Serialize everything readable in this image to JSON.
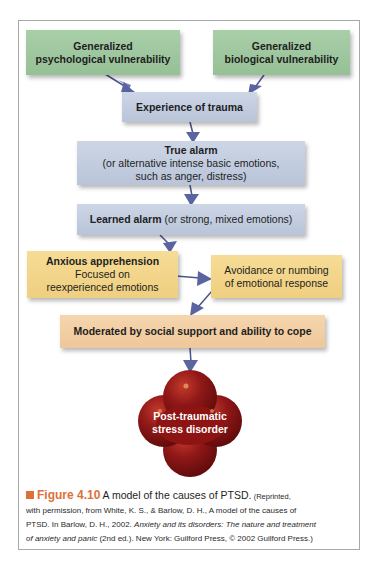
{
  "figure": {
    "number": "Figure 4.10",
    "title": "A model of the causes of PTSD.",
    "credit_line1": "(Reprinted,",
    "credit_line2": "with permission, from White, K. S., & Barlow, D. H., A model of the causes of",
    "credit_line3_pre": "PTSD. In Barlow, D. H., 2002. ",
    "credit_book_title_a": "Anxiety and its disorders: The nature and treatment",
    "credit_book_title_b": "of anxiety and panic",
    "credit_line4_post": " (2nd ed.). New York: Guilford Press, © 2002 Guilford Press.)",
    "accent_color": "#e0703a"
  },
  "nodes": {
    "psych_vuln": {
      "title": "Generalized",
      "line2": "psychological vulnerability",
      "color": "#a9cfa9"
    },
    "bio_vuln": {
      "title": "Generalized",
      "line2": "biological vulnerability",
      "color": "#a9cfa9"
    },
    "trauma": {
      "title": "Experience of trauma",
      "color": "#c4cde0"
    },
    "true_alarm": {
      "title": "True alarm",
      "line2": "(or alternative intense basic emotions,",
      "line3": "such as anger, distress)",
      "color": "#c4cde0"
    },
    "learned_alarm": {
      "title": "Learned alarm",
      "rest": " (or strong, mixed emotions)",
      "color": "#c4cde0"
    },
    "anxious": {
      "title": "Anxious apprehension",
      "line2": "Focused on",
      "line3": "reexperienced emotions",
      "color": "#f3d68c"
    },
    "avoidance": {
      "line1": "Avoidance or numbing",
      "line2": "of emotional response",
      "color": "#f3d68c"
    },
    "moderated": {
      "title": "Moderated by social support and ability to cope",
      "color": "#f2cfa4"
    },
    "ptsd": {
      "line1": "Post-traumatic",
      "line2": "stress disorder",
      "color": "#8e1414"
    }
  },
  "edges": [
    {
      "from": "psych_vuln",
      "to": "trauma"
    },
    {
      "from": "bio_vuln",
      "to": "trauma"
    },
    {
      "from": "trauma",
      "to": "true_alarm"
    },
    {
      "from": "true_alarm",
      "to": "learned_alarm"
    },
    {
      "from": "learned_alarm",
      "to": "anxious"
    },
    {
      "from": "anxious",
      "to": "avoidance"
    },
    {
      "from": "avoidance",
      "to": "moderated"
    },
    {
      "from": "moderated",
      "to": "ptsd"
    }
  ]
}
